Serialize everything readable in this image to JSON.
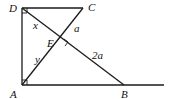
{
  "diagram": {
    "type": "geometry",
    "points": {
      "D": {
        "label": "D",
        "x": 22,
        "y": 8
      },
      "C": {
        "label": "C",
        "x": 83,
        "y": 8
      },
      "A": {
        "label": "A",
        "x": 22,
        "y": 85
      },
      "B": {
        "label": "B",
        "x": 124,
        "y": 85
      },
      "E": {
        "label": "E",
        "x": 61,
        "y": 43
      }
    },
    "segment_labels": {
      "DE": "x",
      "AE": "y",
      "CE": "a",
      "EB": "2a"
    },
    "right_angles": [
      "D",
      "A",
      "E"
    ],
    "stroke_color": "#1a1a1a"
  }
}
